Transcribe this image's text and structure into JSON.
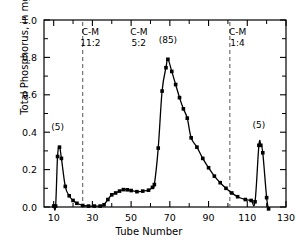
{
  "chart_data": {
    "type": "line",
    "title": "",
    "xlabel": "Tube Number",
    "ylabel": "Total Phosphorus, in mg.",
    "xlim": [
      5,
      130
    ],
    "ylim": [
      0.0,
      1.0
    ],
    "grid": false,
    "legend": "none",
    "x_ticks_major": [
      10,
      30,
      50,
      70,
      90,
      110,
      130
    ],
    "x_tick_labels": [
      "10",
      "30",
      "50",
      "70",
      "90",
      "110",
      "130"
    ],
    "x_ticks_minor": [
      20,
      40,
      60,
      80,
      100,
      120
    ],
    "y_ticks_major": [
      0.0,
      0.2,
      0.4,
      0.6,
      0.8,
      1.0
    ],
    "y_tick_labels": [
      "0.0",
      "0.2",
      "0.4",
      "0.6",
      "0.8",
      "1.0"
    ],
    "y_ticks_minor": [
      0.1,
      0.3,
      0.5,
      0.7,
      0.9
    ],
    "marker": "square",
    "marker_color": "#000000",
    "line_color": "#000000",
    "series": [
      {
        "name": "Total Phosphorus",
        "x": [
          10,
          11,
          12,
          13,
          14,
          16,
          18,
          20,
          22,
          25,
          28,
          31,
          34,
          36,
          38,
          40,
          42,
          44,
          46,
          48,
          50,
          53,
          56,
          59,
          61,
          62,
          64,
          66,
          68,
          69,
          71,
          73,
          75,
          77,
          79,
          81,
          84,
          87,
          90,
          93,
          96,
          99,
          102,
          105,
          109,
          112,
          114,
          116,
          117,
          118,
          120,
          121
        ],
        "y": [
          0.005,
          0.005,
          0.27,
          0.32,
          0.26,
          0.11,
          0.06,
          0.035,
          0.02,
          0.008,
          0.005,
          0.005,
          0.005,
          0.012,
          0.04,
          0.065,
          0.075,
          0.085,
          0.093,
          0.092,
          0.088,
          0.082,
          0.085,
          0.09,
          0.105,
          0.12,
          0.315,
          0.62,
          0.745,
          0.79,
          0.725,
          0.655,
          0.585,
          0.525,
          0.475,
          0.37,
          0.32,
          0.26,
          0.21,
          0.165,
          0.13,
          0.1,
          0.075,
          0.055,
          0.04,
          0.035,
          0.028,
          0.33,
          0.33,
          0.29,
          0.05,
          -0.01
        ]
      }
    ],
    "dividers": [
      {
        "x": 25,
        "style": "dashed"
      },
      {
        "x": 101,
        "style": "dashed"
      }
    ],
    "annotations": [
      {
        "name": "region-label-1",
        "line1": "C-M",
        "line2": "11:2",
        "x": 29,
        "y": 0.92
      },
      {
        "name": "region-label-2",
        "line1": "C-M",
        "line2": "5:2",
        "x": 54,
        "y": 0.92
      },
      {
        "name": "region-label-3",
        "line1": "C-M",
        "line2": "1:4",
        "x": 105,
        "y": 0.92
      },
      {
        "name": "peak-label-left",
        "text": "(5)",
        "x": 12,
        "y": 0.41
      },
      {
        "name": "peak-label-center",
        "text": "(85)",
        "x": 69,
        "y": 0.875
      },
      {
        "name": "peak-label-right",
        "text": "(5)",
        "x": 116,
        "y": 0.425
      }
    ]
  }
}
